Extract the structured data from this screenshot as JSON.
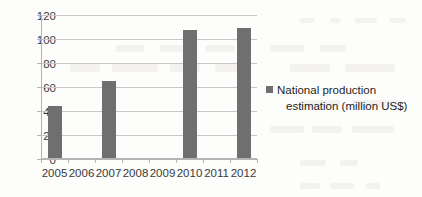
{
  "chart_data": {
    "type": "bar",
    "title": "",
    "subtitle": "",
    "xlabel": "",
    "ylabel": "",
    "categories": [
      "2005",
      "2006",
      "2007",
      "2008",
      "2009",
      "2010",
      "2011",
      "2012"
    ],
    "values": [
      43,
      null,
      64,
      null,
      null,
      107,
      null,
      108
    ],
    "series": [
      {
        "name": "National production estimation (million US$)",
        "values": [
          43,
          null,
          64,
          null,
          null,
          107,
          null,
          108
        ]
      }
    ],
    "ylim": [
      0,
      120
    ],
    "yticks": [
      0,
      20,
      40,
      60,
      80,
      100,
      120
    ],
    "ytick_labels": [
      "0",
      "20",
      "40",
      "60",
      "80",
      "100",
      "120"
    ],
    "grid": true,
    "grid_axis": "y",
    "legend": {
      "position": "right",
      "entries": [
        {
          "label_line1": "National production",
          "label_line2": "estimation (million US$)",
          "label_full": "National production estimation (million US$)",
          "color": "#6f6f6f",
          "marker": "square-swatch"
        }
      ]
    },
    "colors": {
      "bar": "#6f6f6f",
      "gridline": "#c8c8c8",
      "axis": "#b4b4b4",
      "tick_text": "#3a3a3a",
      "legend_text": "#1d1d1d",
      "background": "#fdfdfc"
    }
  }
}
